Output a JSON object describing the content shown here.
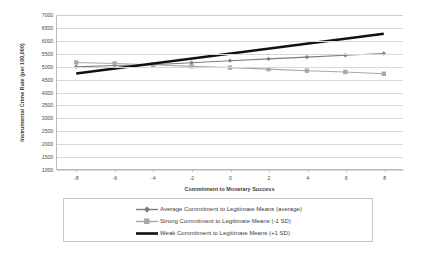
{
  "chart_data": {
    "type": "line",
    "title": "",
    "xlabel": "Commitment to Monetary Success",
    "ylabel": "Instrumental Crime Rate (per 100,000)",
    "xlim": [
      -9,
      9
    ],
    "ylim": [
      1000,
      7000
    ],
    "x_ticks": [
      -8,
      -6,
      -4,
      -2,
      0,
      2,
      4,
      6,
      8
    ],
    "y_ticks": [
      1000,
      1500,
      2000,
      2500,
      3000,
      3500,
      4000,
      4500,
      5000,
      5500,
      6000,
      6500,
      7000
    ],
    "grid": true,
    "legend_position": "bottom",
    "x": [
      -8,
      -6,
      -4,
      -2,
      0,
      2,
      4,
      6,
      8
    ],
    "series": [
      {
        "name": "Average Commitment to Legitimate Means (average)",
        "values": [
          4980,
          5030,
          5060,
          5140,
          5220,
          5290,
          5360,
          5430,
          5500
        ],
        "color": "#7d7d7d",
        "marker": "diamond",
        "width": 1.1
      },
      {
        "name": "Strong Commitment to Legitimate Means (-1 SD)",
        "values": [
          5150,
          5110,
          5060,
          5000,
          4950,
          4890,
          4830,
          4780,
          4710
        ],
        "color": "#a8a8a8",
        "marker": "square",
        "width": 1.1
      },
      {
        "name": "Weak Commitment to Legitimate Means (+1 SD)",
        "values": [
          4720,
          5110,
          5500,
          5890,
          6270,
          6270,
          6270,
          6270,
          6270
        ],
        "color": "#111111",
        "marker": "none",
        "width": 2.4,
        "line_endpoints": [
          [
            -8,
            4720
          ],
          [
            8,
            6270
          ]
        ]
      }
    ]
  },
  "legend": {
    "entries": [
      {
        "label": "Average Commitment to Legitimate Means (average)",
        "marker": "diamond",
        "color": "#7d7d7d"
      },
      {
        "label": "Strong Commitment to Legitimate Means (-1 SD)",
        "marker": "square",
        "color": "#a8a8a8"
      },
      {
        "label": "Weak Commitment to Legitimate Means (+1 SD)",
        "marker": "none",
        "color": "#111111"
      }
    ]
  },
  "axes": {
    "x_title": "Commitment to Monetary Success",
    "y_title": "Instrumental Crime Rate (per 100,000)"
  }
}
